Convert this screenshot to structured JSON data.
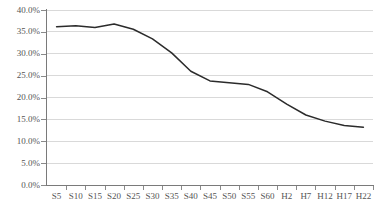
{
  "chart_data": {
    "type": "line",
    "title": "",
    "subtitle": "",
    "xlabel": "",
    "ylabel": "",
    "grid": true,
    "legend": "none",
    "categories": [
      "S5",
      "S10",
      "S15",
      "S20",
      "S25",
      "S30",
      "S35",
      "S40",
      "S45",
      "S50",
      "S55",
      "S60",
      "H2",
      "H7",
      "H12",
      "H17",
      "H22"
    ],
    "values": [
      36.2,
      36.4,
      36.0,
      36.8,
      35.6,
      33.4,
      30.2,
      26.0,
      23.8,
      23.4,
      23.0,
      21.3,
      18.5,
      16.0,
      14.6,
      13.6,
      13.2
    ],
    "series": [
      {
        "name": "",
        "values": [
          36.2,
          36.4,
          36.0,
          36.8,
          35.6,
          33.4,
          30.2,
          26.0,
          23.8,
          23.4,
          23.0,
          21.3,
          18.5,
          16.0,
          14.6,
          13.6,
          13.2
        ]
      }
    ],
    "ylim": [
      0,
      40
    ],
    "ytick_interval": 5,
    "ytick_labels": [
      "40.0%",
      "35.0%",
      "30.0%",
      "25.0%",
      "20.0%",
      "15.0%",
      "10.0%",
      "5.0%",
      "0.0%"
    ],
    "ytick_values": [
      40,
      35,
      30,
      25,
      20,
      15,
      10,
      5,
      0
    ],
    "line_color": "#2b2b2b",
    "grid_color": "#c9c9c9",
    "axis_color": "#7a7a7a",
    "background_color": "#ffffff"
  }
}
